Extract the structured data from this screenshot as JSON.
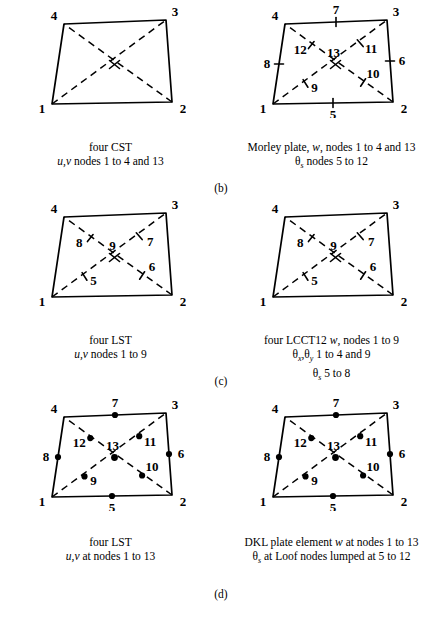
{
  "figure": {
    "panels": [
      {
        "id": "b",
        "panel_label": "(b)",
        "left": {
          "diagram_name": "four-cst-quadrilateral",
          "marker_style": "cross",
          "corner_labels": [
            "1",
            "2",
            "3",
            "4"
          ],
          "center_label": "",
          "edge_node_labels": [],
          "diagonal_node_labels": [],
          "caption": [
            "four CST",
            "u,v nodes 1 to 4 and 13"
          ]
        },
        "right": {
          "diagram_name": "morley-plate-quadrilateral",
          "marker_style": "cross",
          "corner_labels": [
            "1",
            "2",
            "3",
            "4"
          ],
          "center_label": "13",
          "edge_node_labels": [
            "5",
            "6",
            "7",
            "8"
          ],
          "diagonal_node_labels": [
            "9",
            "10",
            "11",
            "12"
          ],
          "caption": [
            "Morley plate, w, nodes 1 to 4 and 13",
            "θs nodes 5 to 12"
          ]
        }
      },
      {
        "id": "c",
        "panel_label": "(c)",
        "left": {
          "diagram_name": "four-lst-quadrilateral",
          "marker_style": "cross",
          "corner_labels": [
            "1",
            "2",
            "3",
            "4"
          ],
          "center_label": "9",
          "edge_node_labels": [],
          "diagonal_node_labels": [
            "5",
            "6",
            "7",
            "8"
          ],
          "caption": [
            "four LST",
            "u,v nodes 1 to 9"
          ]
        },
        "right": {
          "diagram_name": "four-lcct12-quadrilateral",
          "marker_style": "cross",
          "corner_labels": [
            "1",
            "2",
            "3",
            "4"
          ],
          "center_label": "9",
          "edge_node_labels": [],
          "diagonal_node_labels": [
            "5",
            "6",
            "7",
            "8"
          ],
          "caption": [
            "four LCCT12 w, nodes 1 to 9",
            "θx,θy 1 to 4 and 9",
            "θs 5 to 8"
          ]
        }
      },
      {
        "id": "d",
        "panel_label": "(d)",
        "left": {
          "diagram_name": "four-lst-13node-quadrilateral",
          "marker_style": "dot",
          "corner_labels": [
            "1",
            "2",
            "3",
            "4"
          ],
          "center_label": "13",
          "edge_node_labels": [
            "5",
            "6",
            "7",
            "8"
          ],
          "diagonal_node_labels": [
            "9",
            "10",
            "11",
            "12"
          ],
          "caption": [
            "four LST",
            "u,v at nodes 1 to 13"
          ]
        },
        "right": {
          "diagram_name": "dkl-plate-element-quadrilateral",
          "marker_style": "dot",
          "corner_labels": [
            "1",
            "2",
            "3",
            "4"
          ],
          "center_label": "13",
          "edge_node_labels": [
            "5",
            "6",
            "7",
            "8"
          ],
          "diagonal_node_labels": [
            "9",
            "10",
            "11",
            "12"
          ],
          "caption": [
            "DKL plate element w at nodes 1 to 13",
            "θs at Loof nodes lumped at 5 to 12"
          ]
        }
      }
    ]
  }
}
